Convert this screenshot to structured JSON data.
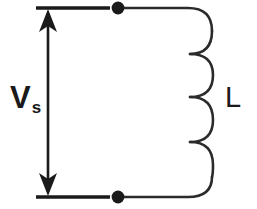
{
  "diagram": {
    "type": "electrical-schematic",
    "background_color": "#ffffff",
    "line_color": "#1a1a1a",
    "labels": {
      "source": {
        "symbol": "V",
        "subscript": "s",
        "full": "Vs",
        "meaning": "source voltage"
      },
      "inductor": {
        "symbol": "L",
        "meaning": "inductance"
      }
    },
    "components": [
      {
        "name": "voltage-source-arrow",
        "kind": "double-headed-arrow",
        "x": 48,
        "y_top": 10,
        "y_bottom": 195,
        "label": "Vs"
      },
      {
        "name": "top-terminal-line",
        "kind": "horizontal-wire",
        "x_start": 36,
        "x_end": 110,
        "y": 8
      },
      {
        "name": "bottom-terminal-line",
        "kind": "horizontal-wire",
        "x_start": 36,
        "x_end": 110,
        "y": 197
      },
      {
        "name": "top-node-dot",
        "kind": "junction-dot",
        "x": 118,
        "y": 8,
        "radius": 6
      },
      {
        "name": "bottom-node-dot",
        "kind": "junction-dot",
        "x": 118,
        "y": 197,
        "radius": 6
      },
      {
        "name": "inductor-coil",
        "kind": "coil",
        "turns": 4,
        "x_spine": 188,
        "x_bulge": 212,
        "y_top": 8,
        "y_bottom": 197,
        "label": "L"
      }
    ]
  }
}
